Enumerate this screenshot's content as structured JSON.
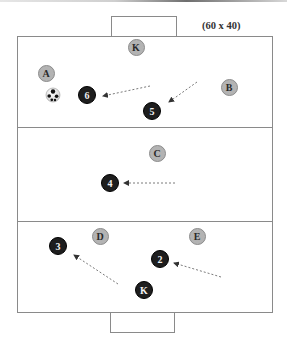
{
  "diagram": {
    "dimension_label": "(60 x 40)",
    "colors": {
      "field_line": "#8a8a8a",
      "opponent_fill": "#b3b3b3",
      "teammate_fill": "#1e1e1e",
      "arrow": "#7a7a7a"
    },
    "field": {
      "x": 17,
      "y": 36,
      "width": 255,
      "height": 276
    },
    "zone_dividers_y": [
      127,
      221
    ],
    "goals": [
      {
        "name": "top-goal",
        "x": 111,
        "y": 16,
        "width": 65,
        "height": 20
      },
      {
        "name": "bottom-goal",
        "x": 110,
        "y": 312,
        "width": 64,
        "height": 20
      }
    ],
    "ball": {
      "x": 53,
      "y": 95
    },
    "opponents": [
      {
        "label": "K",
        "x": 136,
        "y": 47
      },
      {
        "label": "A",
        "x": 46,
        "y": 73
      },
      {
        "label": "B",
        "x": 229,
        "y": 87
      },
      {
        "label": "C",
        "x": 157,
        "y": 153
      },
      {
        "label": "D",
        "x": 100,
        "y": 236
      },
      {
        "label": "E",
        "x": 197,
        "y": 236
      }
    ],
    "teammates": [
      {
        "label": "6",
        "x": 87,
        "y": 95
      },
      {
        "label": "5",
        "x": 152,
        "y": 111
      },
      {
        "label": "4",
        "x": 110,
        "y": 183
      },
      {
        "label": "3",
        "x": 58,
        "y": 246
      },
      {
        "label": "2",
        "x": 160,
        "y": 259
      },
      {
        "label": "K",
        "x": 144,
        "y": 290
      }
    ],
    "arrows": [
      {
        "from": [
          150,
          86
        ],
        "to": [
          103,
          96
        ]
      },
      {
        "from": [
          197,
          82
        ],
        "to": [
          169,
          102
        ]
      },
      {
        "from": [
          175,
          183
        ],
        "to": [
          124,
          183
        ]
      },
      {
        "from": [
          118,
          284
        ],
        "to": [
          74,
          255
        ]
      },
      {
        "from": [
          221,
          277
        ],
        "to": [
          174,
          263
        ]
      }
    ]
  }
}
